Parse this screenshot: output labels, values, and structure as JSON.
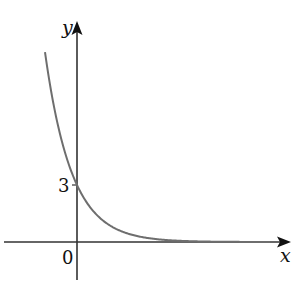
{
  "axes": {
    "x_label": "x",
    "y_label": "y",
    "origin_label": "0",
    "y_tick_label": "3"
  },
  "colors": {
    "axis": "#333333",
    "curve": "#6e6e6e",
    "text": "#111111"
  },
  "chart_data": {
    "type": "line",
    "title": "",
    "xlabel": "x",
    "ylabel": "y",
    "function": "y = 3·a^(-x), a > 1 (exponential decay)",
    "y_intercept": 3,
    "asymptote": "y = 0",
    "annotations": [
      "0",
      "3"
    ],
    "grid": false
  }
}
